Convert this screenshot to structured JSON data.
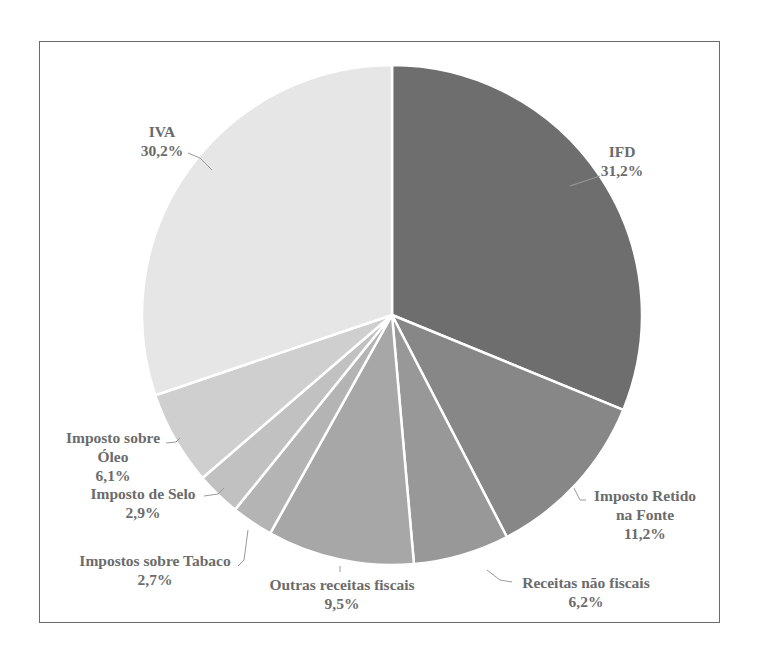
{
  "chart_data": {
    "type": "pie",
    "title": "",
    "start_angle_deg": 0,
    "direction": "clockwise",
    "slices": [
      {
        "label": "IFD",
        "value": 31.2,
        "display": "31,2%",
        "color": "#6e6e6e"
      },
      {
        "label": "Imposto Retido na Fonte",
        "value": 11.2,
        "display": "11,2%",
        "color": "#878787"
      },
      {
        "label": "Receitas não fiscais",
        "value": 6.2,
        "display": "6,2%",
        "color": "#989898"
      },
      {
        "label": "Outras receitas fiscais",
        "value": 9.5,
        "display": "9,5%",
        "color": "#a7a7a7"
      },
      {
        "label": "Impostos sobre Tabaco",
        "value": 2.7,
        "display": "2,7%",
        "color": "#b4b4b4"
      },
      {
        "label": "Imposto de Selo",
        "value": 2.9,
        "display": "2,9%",
        "color": "#c1c1c1"
      },
      {
        "label": "Imposto sobre Óleo",
        "value": 6.1,
        "display": "6,1%",
        "color": "#cfcfcf"
      },
      {
        "label": "IVA",
        "value": 30.2,
        "display": "30,2%",
        "color": "#e6e6e6"
      }
    ],
    "legend": "none (data labels with leader lines)"
  },
  "labels": {
    "ifd": {
      "line1": "IFD",
      "pct": "31,2%"
    },
    "iva": {
      "line1": "IVA",
      "pct": "30,2%"
    },
    "retido": {
      "line1": "Imposto Retido",
      "line2": "na Fonte",
      "pct": "11,2%"
    },
    "nao_fiscais": {
      "line1": "Receitas não fiscais",
      "pct": "6,2%"
    },
    "outras": {
      "line1": "Outras receitas fiscais",
      "pct": "9,5%"
    },
    "tabaco": {
      "line1": "Impostos sobre Tabaco",
      "pct": "2,7%"
    },
    "selo": {
      "line1": "Imposto de Selo",
      "pct": "2,9%"
    },
    "oleo": {
      "line1": "Imposto sobre",
      "line2": "Óleo",
      "pct": "6,1%"
    }
  }
}
